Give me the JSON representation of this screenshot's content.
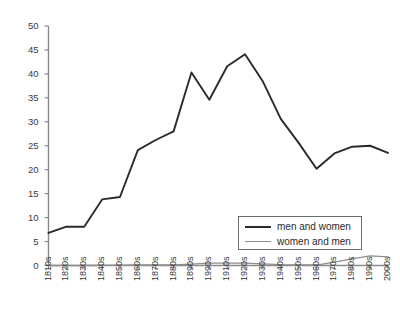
{
  "chart_data": {
    "type": "line",
    "title": "",
    "xlabel": "",
    "ylabel": "",
    "ylim": [
      0,
      50
    ],
    "ytick_values": [
      0,
      5,
      10,
      15,
      20,
      25,
      30,
      35,
      40,
      45,
      50
    ],
    "ytick_labels": [
      "0",
      "5",
      "10",
      "15",
      "20",
      "25",
      "30",
      "35",
      "40",
      "45",
      "50"
    ],
    "grid": false,
    "legend_position": "inside-lower-right",
    "categories": [
      "1810s",
      "1820s",
      "1830s",
      "1840s",
      "1850s",
      "1860s",
      "1870s",
      "1880s",
      "1890s",
      "1990s",
      "1910s",
      "1920s",
      "1930s",
      "1940s",
      "1950s",
      "1960s",
      "1970s",
      "1980s",
      "1990s",
      "2000s"
    ],
    "series": [
      {
        "name": "men and women",
        "color": "#2b2b2b",
        "values": [
          6.8,
          8.1,
          8.1,
          13.8,
          14.3,
          24.1,
          26.2,
          28.0,
          40.3,
          34.6,
          41.6,
          44.1,
          38.4,
          30.6,
          25.6,
          20.2,
          23.4,
          24.8,
          25.0,
          23.5
        ]
      },
      {
        "name": "women and men",
        "color": "#8d8d8d",
        "values": [
          0.0,
          0.0,
          0.0,
          0.05,
          0.05,
          0.1,
          0.1,
          0.1,
          0.3,
          0.5,
          0.5,
          0.5,
          0.35,
          0.2,
          0.15,
          0.1,
          0.7,
          1.4,
          2.0,
          1.8
        ]
      }
    ]
  },
  "legend": {
    "items": [
      {
        "label": "men and women"
      },
      {
        "label": "women and men"
      }
    ]
  }
}
